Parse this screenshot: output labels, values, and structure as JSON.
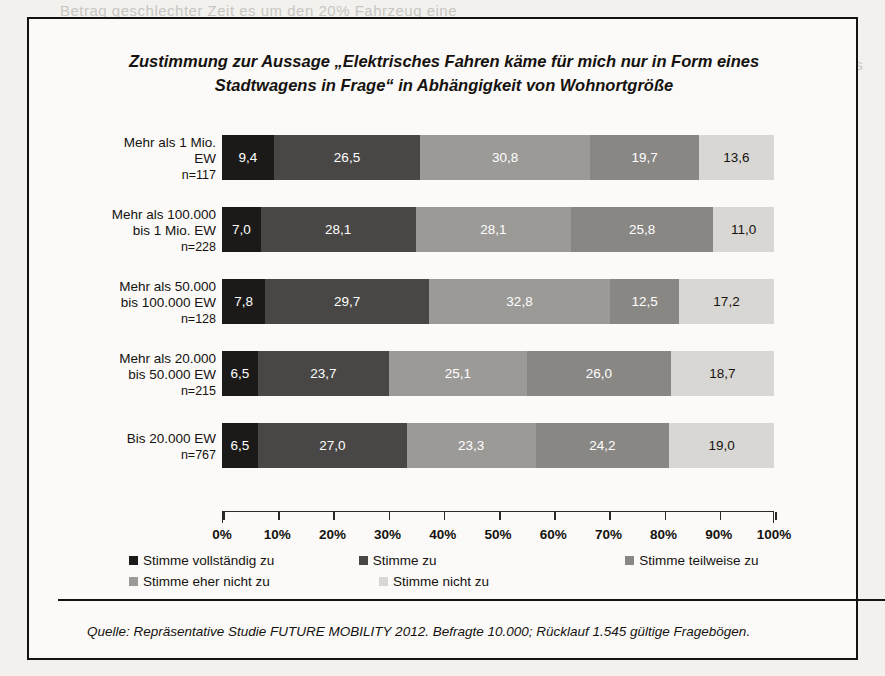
{
  "figure": {
    "title": "Zustimmung zur Aussage „Elektrisches Fahren käme für mich nur in Form eines Stadtwagens in Frage“ in Abhängigkeit von Wohnortgröße",
    "source": "Quelle: Repräsentative Studie FUTURE MOBILITY 2012. Befragte 10.000; Rücklauf 1.545 gültige Fragebögen."
  },
  "chart_data": {
    "type": "bar",
    "orientation": "horizontal",
    "stacked": true,
    "stack_mode": "percent",
    "title": "Zustimmung zur Aussage „Elektrisches Fahren käme für mich nur in Form eines Stadtwagens in Frage“ in Abhängigkeit von Wohnortgröße",
    "xlabel": "",
    "ylabel": "",
    "xlim": [
      0,
      100
    ],
    "grid": false,
    "legend_position": "bottom",
    "xticks": [
      0,
      10,
      20,
      30,
      40,
      50,
      60,
      70,
      80,
      90,
      100
    ],
    "xtick_labels": [
      "0%",
      "10%",
      "20%",
      "30%",
      "40%",
      "50%",
      "60%",
      "70%",
      "80%",
      "90%",
      "100%"
    ],
    "categories": [
      "Mehr als 1 Mio. EW",
      "Mehr als 100.000 bis 1 Mio. EW",
      "Mehr als 50.000 bis 100.000 EW",
      "Mehr als 20.000 bis 50.000 EW",
      "Bis 20.000 EW"
    ],
    "category_lines": [
      [
        "Mehr als 1 Mio.",
        "EW"
      ],
      [
        "Mehr als 100.000",
        "bis 1 Mio. EW"
      ],
      [
        "Mehr als 50.000",
        "bis 100.000 EW"
      ],
      [
        "Mehr als 20.000",
        "bis 50.000 EW"
      ],
      [
        "Bis 20.000 EW"
      ]
    ],
    "category_n": [
      "n=117",
      "n=228",
      "n=128",
      "n=215",
      "n=767"
    ],
    "series": [
      {
        "name": "Stimme vollständig zu",
        "color": "#1c1a18",
        "values": [
          9.4,
          7.0,
          7.8,
          6.5,
          6.5
        ],
        "labels": [
          "9,4",
          "7,0",
          "7,8",
          "6,5",
          "6,5"
        ]
      },
      {
        "name": "Stimme zu",
        "color": "#494745",
        "values": [
          26.5,
          28.1,
          29.7,
          23.7,
          27.0
        ],
        "labels": [
          "26,5",
          "28,1",
          "29,7",
          "23,7",
          "27,0"
        ]
      },
      {
        "name": "Stimme teilweise zu",
        "color": "#9c9a97",
        "values": [
          30.8,
          28.1,
          32.8,
          25.1,
          23.3
        ],
        "labels": [
          "30,8",
          "28,1",
          "32,8",
          "25,1",
          "23,3"
        ]
      },
      {
        "name": "Stimme eher nicht zu",
        "color": "#898784",
        "values": [
          19.7,
          25.8,
          12.5,
          26.0,
          24.2
        ],
        "labels": [
          "19,7",
          "25,8",
          "12,5",
          "26,0",
          "24,2"
        ]
      },
      {
        "name": "Stimme nicht zu",
        "color": "#d9d7d3",
        "values": [
          13.6,
          11.0,
          17.2,
          18.7,
          19.0
        ],
        "labels": [
          "13,6",
          "11,0",
          "17,2",
          "18,7",
          "19,0"
        ]
      }
    ]
  },
  "legend": {
    "row1": [
      {
        "label": "Stimme vollständig zu",
        "color": "#1c1a18"
      },
      {
        "label": "Stimme zu",
        "color": "#494745"
      },
      {
        "label": "Stimme teilweise zu",
        "color": "#898784"
      }
    ],
    "row2": [
      {
        "label": "Stimme eher nicht zu",
        "color": "#9c9a97"
      },
      {
        "label": "Stimme nicht zu",
        "color": "#d9d7d3"
      }
    ]
  },
  "bleed_text": [
    "Betrag geschlechter Zeit es um den 20%  Fahrzeug eine",
    "auf der Vorrang es sich aber auch nicht in den dies",
    "wahrscheinlich zahlt in erster Linie im Sektor",
    "Verbrauch"
  ]
}
